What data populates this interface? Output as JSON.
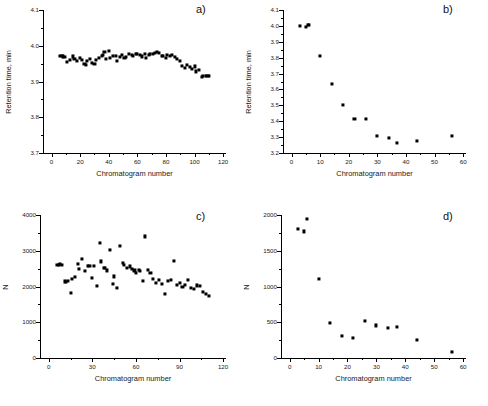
{
  "figure": {
    "background": "#ffffff",
    "marker_color": "#000000",
    "axis_color": "#000000"
  },
  "chart_data": [
    {
      "type": "scatter",
      "panel": "a)",
      "title": "",
      "xlabel": "Chromatogram number",
      "ylabel": "Retention time, min",
      "xlim": [
        -6,
        122
      ],
      "ylim": [
        3.7,
        4.1
      ],
      "xticks": [
        0,
        20,
        40,
        60,
        80,
        100,
        120
      ],
      "xticklabels": [
        "0",
        "20",
        "40",
        "60",
        "80",
        "100",
        "120"
      ],
      "yticks": [
        3.7,
        3.8,
        3.9,
        4.0,
        4.1
      ],
      "yticklabels": [
        "3.7",
        "3.8",
        "3.9",
        "4.0",
        "4.1"
      ],
      "grid": false,
      "legend": "none",
      "x": [
        6,
        7,
        8,
        9,
        11,
        13,
        15,
        16,
        18,
        20,
        21,
        23,
        24,
        25,
        27,
        28,
        30,
        31,
        33,
        35,
        36,
        37,
        38,
        40,
        41,
        43,
        45,
        46,
        48,
        49,
        51,
        52,
        54,
        56,
        57,
        59,
        60,
        62,
        63,
        65,
        66,
        68,
        69,
        71,
        72,
        74,
        75,
        77,
        78,
        80,
        81,
        83,
        84,
        86,
        88,
        90,
        91,
        93,
        95,
        97,
        98,
        100,
        101,
        103,
        105,
        106,
        108,
        109,
        110
      ],
      "y": [
        3.972,
        3.971,
        3.97,
        3.968,
        3.955,
        3.961,
        3.97,
        3.963,
        3.958,
        3.966,
        3.96,
        3.95,
        3.946,
        3.957,
        3.962,
        3.951,
        3.948,
        3.96,
        3.966,
        3.972,
        3.974,
        3.982,
        3.963,
        3.985,
        3.967,
        3.972,
        3.971,
        3.958,
        3.968,
        3.975,
        3.965,
        3.968,
        3.976,
        3.973,
        3.972,
        3.978,
        3.976,
        3.974,
        3.97,
        3.978,
        3.966,
        3.974,
        3.976,
        3.978,
        3.979,
        3.983,
        3.98,
        3.971,
        3.972,
        3.966,
        3.975,
        3.972,
        3.973,
        3.968,
        3.962,
        3.958,
        3.944,
        3.937,
        3.946,
        3.94,
        3.935,
        3.942,
        3.928,
        3.932,
        3.913,
        3.915,
        3.916,
        3.915,
        3.916
      ]
    },
    {
      "type": "scatter",
      "panel": "b)",
      "title": "",
      "xlabel": "Chromatogram number",
      "ylabel": "Retention time, min",
      "xlim": [
        -3,
        61
      ],
      "ylim": [
        3.2,
        4.1
      ],
      "xticks": [
        0,
        10,
        20,
        30,
        40,
        50,
        60
      ],
      "xticklabels": [
        "0",
        "10",
        "20",
        "30",
        "40",
        "50",
        "60"
      ],
      "yticks": [
        3.2,
        3.3,
        3.4,
        3.5,
        3.6,
        3.7,
        3.8,
        3.9,
        4.0,
        4.1
      ],
      "yticklabels": [
        "3.2",
        "3.3",
        "3.4",
        "3.5",
        "3.6",
        "3.7",
        "3.8",
        "3.9",
        "4.0",
        "4.1"
      ],
      "grid": false,
      "legend": "none",
      "x": [
        3,
        5,
        5.6,
        6,
        10,
        14,
        18,
        22,
        26,
        30,
        34,
        37,
        44,
        56
      ],
      "y": [
        3.998,
        3.991,
        4.006,
        4.008,
        3.811,
        3.632,
        3.503,
        3.416,
        3.414,
        3.305,
        3.292,
        3.266,
        3.277,
        3.307
      ]
    },
    {
      "type": "scatter",
      "panel": "c)",
      "title": "",
      "xlabel": "Chromatogram number",
      "ylabel": "N",
      "xlim": [
        -6,
        122
      ],
      "ylim": [
        0,
        4000
      ],
      "xticks": [
        0,
        30,
        60,
        90,
        120
      ],
      "xticklabels": [
        "0",
        "30",
        "60",
        "90",
        "120"
      ],
      "yticks": [
        0,
        1000,
        2000,
        3000,
        4000
      ],
      "yticklabels": [
        "0",
        "1000",
        "2000",
        "3000",
        "4000"
      ],
      "grid": false,
      "legend": "none",
      "x": [
        6,
        7,
        8,
        9,
        11,
        12,
        13,
        15,
        16,
        18,
        20,
        21,
        23,
        25,
        27,
        28,
        30,
        31,
        33,
        35,
        36,
        38,
        39,
        40,
        42,
        44,
        45,
        47,
        49,
        51,
        52,
        54,
        56,
        57,
        59,
        60,
        62,
        63,
        65,
        66,
        68,
        70,
        72,
        74,
        76,
        78,
        80,
        82,
        84,
        86,
        88,
        90,
        92,
        94,
        96,
        98,
        100,
        102,
        104,
        106,
        108,
        110
      ],
      "y": [
        2600,
        2610,
        2620,
        2615,
        2140,
        2130,
        2160,
        1810,
        2220,
        2260,
        2620,
        2500,
        2780,
        2430,
        2580,
        2580,
        2240,
        2575,
        2020,
        3210,
        2700,
        2520,
        2530,
        2450,
        3010,
        2060,
        2280,
        1970,
        3140,
        2660,
        2600,
        2530,
        2560,
        2490,
        2450,
        2390,
        2470,
        2430,
        2160,
        3400,
        2470,
        2380,
        2200,
        2090,
        2180,
        2060,
        1800,
        2160,
        2180,
        2720,
        2040,
        2110,
        2000,
        2040,
        2190,
        1970,
        1930,
        2030,
        2010,
        1850,
        1790,
        1740
      ]
    },
    {
      "type": "scatter",
      "panel": "d)",
      "title": "",
      "xlabel": "Chromatogram number",
      "ylabel": "N",
      "xlim": [
        -3,
        61
      ],
      "ylim": [
        0,
        2000
      ],
      "xticks": [
        0,
        10,
        20,
        30,
        40,
        50,
        60
      ],
      "xticklabels": [
        "0",
        "10",
        "20",
        "30",
        "40",
        "50",
        "60"
      ],
      "yticks": [
        0,
        500,
        1000,
        1500,
        2000
      ],
      "yticklabels": [
        "0",
        "500",
        "1000",
        "1500",
        "2000"
      ],
      "grid": false,
      "legend": "none",
      "x": [
        3,
        5,
        6,
        10,
        14,
        18,
        22,
        26,
        30,
        34,
        37,
        44,
        56
      ],
      "y": [
        1810,
        1770,
        1950,
        1110,
        490,
        310,
        280,
        515,
        455,
        425,
        430,
        255,
        85
      ]
    }
  ]
}
